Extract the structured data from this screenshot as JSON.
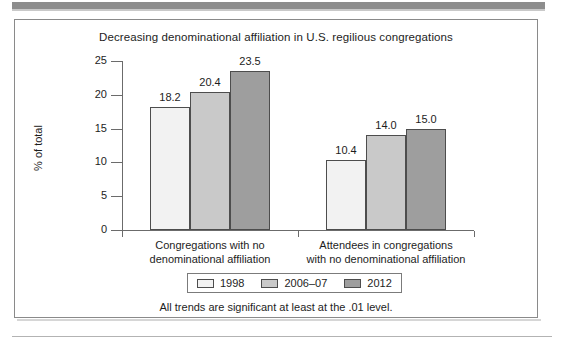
{
  "figure": {
    "title": "Decreasing denominational affiliation in U.S. regilious congregations",
    "footnote": "All trends are significant at least at the .01 level."
  },
  "chart_data": {
    "type": "bar",
    "title": "Decreasing denominational affiliation in U.S. regilious congregations",
    "xlabel": "",
    "ylabel": "% of total",
    "ylim": [
      0,
      25
    ],
    "yticks": [
      0,
      5,
      10,
      15,
      20,
      25
    ],
    "ytick_labels": [
      "0",
      "5",
      "10",
      "15",
      "20",
      "25"
    ],
    "grid": false,
    "legend_position": "bottom",
    "categories": [
      "Congregations with no denominational affiliation",
      "Attendees in congregations with no denominational affiliation"
    ],
    "category_lines": [
      [
        "Congregations with no",
        "denominational affiliation"
      ],
      [
        "Attendees in congregations",
        "with no denominational affiliation"
      ]
    ],
    "series": [
      {
        "name": "1998",
        "color": "#f2f2f2",
        "values": [
          18.2,
          10.4
        ],
        "labels": [
          "18.2",
          "10.4"
        ]
      },
      {
        "name": "2006–07",
        "color": "#c9c9c9",
        "values": [
          20.4,
          14.0
        ],
        "labels": [
          "20.4",
          "14.0"
        ]
      },
      {
        "name": "2012",
        "color": "#9e9e9e",
        "values": [
          23.5,
          15.0
        ],
        "labels": [
          "23.5",
          "15.0"
        ]
      }
    ]
  },
  "legend": {
    "items": [
      {
        "label": "1998",
        "color": "#f2f2f2"
      },
      {
        "label": "2006–07",
        "color": "#c9c9c9"
      },
      {
        "label": "2012",
        "color": "#9e9e9e"
      }
    ]
  }
}
